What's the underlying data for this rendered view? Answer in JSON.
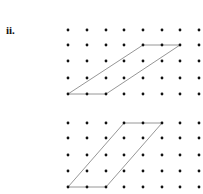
{
  "label": "ii.",
  "colors": {
    "dot": "#111111",
    "line": "#8a8a8a"
  },
  "grid": {
    "xs": [
      68,
      87,
      106,
      124,
      143,
      162,
      180,
      199
    ],
    "dot_radius": 1.4
  },
  "diagrams": [
    {
      "name": "top-dot-grid",
      "ys": [
        30,
        45,
        61,
        78,
        94
      ],
      "parallelogram": [
        [
          68,
          94
        ],
        [
          106,
          94
        ],
        [
          180,
          45
        ],
        [
          143,
          45
        ]
      ],
      "description": "Parallelogram with base 2 units (bottom row) and top side 2 units, top shifted right 4 units and up 3 rows"
    },
    {
      "name": "bottom-dot-grid",
      "ys": [
        123,
        138,
        155,
        171,
        187
      ],
      "parallelogram": [
        [
          68,
          187
        ],
        [
          106,
          187
        ],
        [
          162,
          123
        ],
        [
          124,
          123
        ]
      ],
      "description": "Parallelogram with base 2 units (bottom row) and top side 2 units, top shifted right 3 units and up 4 rows"
    }
  ]
}
